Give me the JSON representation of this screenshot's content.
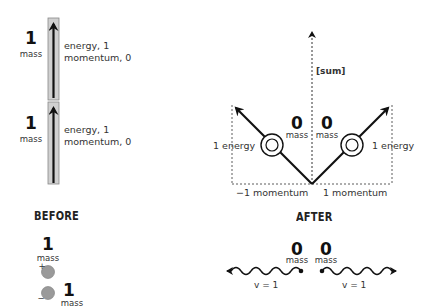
{
  "before": {
    "heading": "BEFORE",
    "particles": [
      {
        "mass_value": "1",
        "mass_label": "mass",
        "energy": "energy, 1",
        "momentum": "momentum, 0"
      },
      {
        "mass_value": "1",
        "mass_label": "mass",
        "energy": "energy, 1",
        "momentum": "momentum, 0"
      }
    ],
    "pair": {
      "top": {
        "mass_value": "1",
        "mass_label": "mass",
        "charge": "+"
      },
      "bottom": {
        "mass_value": "1",
        "mass_label": "mass",
        "charge": "−"
      }
    }
  },
  "after": {
    "heading": "AFTER",
    "sum_label": "[sum]",
    "left": {
      "mass_value": "0",
      "mass_label": "mass",
      "energy": "1 energy",
      "momentum": "−1 momentum",
      "velocity": "v = 1"
    },
    "right": {
      "mass_value": "0",
      "mass_label": "mass",
      "energy": "1 energy",
      "momentum": "1 momentum",
      "velocity": "v = 1"
    }
  },
  "colors": {
    "ink": "#111111",
    "bar_fill": "#d0d0d0",
    "particle_fill": "#9a9a9a"
  }
}
